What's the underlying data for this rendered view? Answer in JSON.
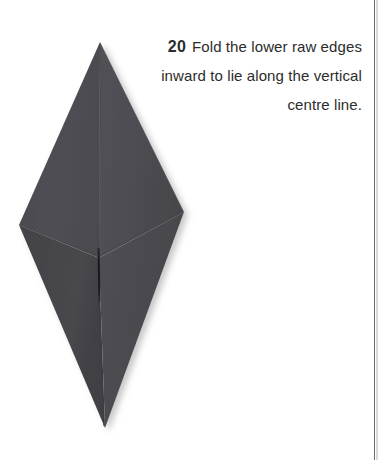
{
  "page": {
    "background_color": "#ffffff",
    "edge_rule_color": "#6d6d6d"
  },
  "instruction": {
    "step_number": "20",
    "text": "Fold the lower raw edges inward to lie along the vertical centre line.",
    "line_1": "Fold the lower raw",
    "line_2": "edges inward to lie along",
    "line_3": "the vertical centre line.",
    "text_color": "#2c2c2c",
    "alignment": "right"
  },
  "illustration": {
    "name": "origami-kite-diamond",
    "description": "Dark grey folded paper kite shape with a vertical centre crease and a dark slit along the lower centre line",
    "paper_color": "#4d4d51",
    "paper_color_light": "#55555a",
    "paper_color_dark": "#424247",
    "crease_color": "#3a3a3f",
    "slit_color": "#1c1c1f",
    "shadow_color": "#c9c9c9",
    "vertices": {
      "top": [
        100,
        42
      ],
      "left": [
        19,
        225
      ],
      "right": [
        184,
        212
      ],
      "bottom": [
        105,
        428
      ]
    },
    "centre_line_x": 99,
    "slit_top_y": 248,
    "slit_bottom_y": 305
  }
}
